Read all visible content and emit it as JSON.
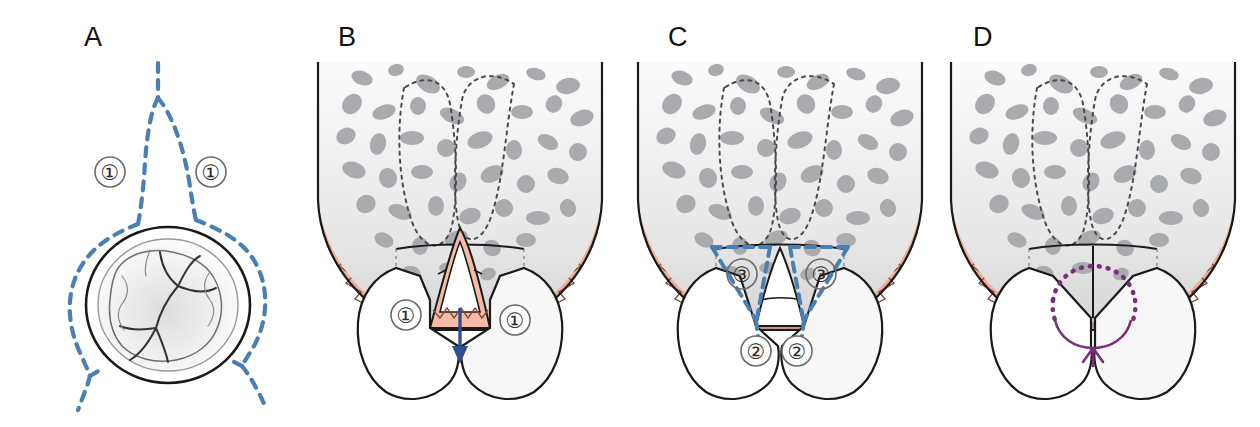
{
  "figure": {
    "background_color": "#ffffff",
    "width": 1260,
    "height": 427
  },
  "palette": {
    "incision_blue": "#4a7fb5",
    "arrow_blue": "#2f4f8f",
    "suture_purple": "#7b2f7b",
    "outline_black": "#1a1a1a",
    "mucosa_pink": "#f6cfc6",
    "gingiva_salmon": "#f3b49e",
    "gingiva_dark": "#c79383",
    "connective_mauve": "#cfb4ae",
    "bone_light": "#f2f2f2",
    "bone_gray": "#a8aaad",
    "tooth_white": "#ffffff"
  },
  "panels": [
    {
      "id": "A",
      "letter": "A",
      "view": "occlusal view of molar with dashed incision outline",
      "labels": [
        {
          "text": "①",
          "meaning": "incision-line-1",
          "position": "left"
        },
        {
          "text": "①",
          "meaning": "incision-line-1",
          "position": "right"
        }
      ],
      "annotations": [
        {
          "name": "incision-dashed-outline",
          "color": "#4a7fb5",
          "style": "dashed"
        },
        {
          "name": "molar-occlusal-surface",
          "color": "#1a1a1a",
          "style": "solid"
        }
      ]
    },
    {
      "id": "B",
      "letter": "B",
      "view": "buccal cross-section with reflected interdental papilla",
      "labels": [
        {
          "text": "①",
          "meaning": "incision-line-1",
          "position": "left"
        },
        {
          "text": "①",
          "meaning": "incision-line-1",
          "position": "right"
        }
      ],
      "annotations": [
        {
          "name": "papilla-reflection-arrow",
          "color": "#2f4f8f",
          "style": "solid-arrow-down"
        },
        {
          "name": "trabecular-bone",
          "color": "#a8aaad",
          "style": "mottled"
        },
        {
          "name": "root-outline-dotted",
          "color": "#555555",
          "style": "dotted"
        }
      ]
    },
    {
      "id": "C",
      "letter": "C",
      "view": "cross-section showing triangular wedge incisions",
      "labels": [
        {
          "text": "③",
          "meaning": "wedge-incision-3",
          "position": "upper-left"
        },
        {
          "text": "③",
          "meaning": "wedge-incision-3",
          "position": "upper-right"
        },
        {
          "text": "②",
          "meaning": "vertical-incision-2",
          "position": "lower-left"
        },
        {
          "text": "②",
          "meaning": "vertical-incision-2",
          "position": "lower-right"
        }
      ],
      "annotations": [
        {
          "name": "wedge-incision-dashed",
          "color": "#4a7fb5",
          "style": "dashed"
        },
        {
          "name": "trabecular-bone",
          "color": "#a8aaad",
          "style": "mottled"
        },
        {
          "name": "root-outline-dotted",
          "color": "#555555",
          "style": "dotted"
        }
      ]
    },
    {
      "id": "D",
      "letter": "D",
      "view": "cross-section after closure with interdental suture",
      "labels": [],
      "annotations": [
        {
          "name": "suture-loop",
          "color": "#7b2f7b",
          "style": "dotted-and-solid-loop"
        },
        {
          "name": "closed-incision-line",
          "color": "#1a1a1a",
          "style": "solid-vertical"
        },
        {
          "name": "trabecular-bone",
          "color": "#a8aaad",
          "style": "mottled"
        },
        {
          "name": "root-outline-dotted",
          "color": "#555555",
          "style": "dotted"
        }
      ]
    }
  ]
}
